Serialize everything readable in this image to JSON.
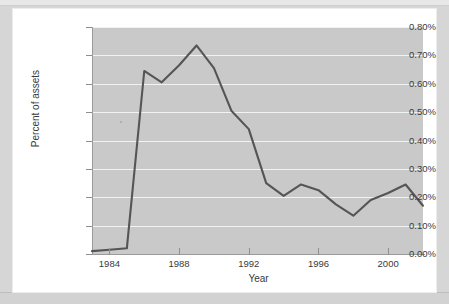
{
  "figure": {
    "background_color": "#ffffff",
    "page_background_color": "#d6d6d6",
    "plot_background_color": "#c9c9c9",
    "gridline_color": "#f2f2f2",
    "line_color": "#555555"
  },
  "chart_data": {
    "type": "line",
    "title": "",
    "xlabel": "Year",
    "ylabel": "Percent of assets",
    "xlim": [
      1983,
      2002
    ],
    "ylim": [
      0.0,
      0.8
    ],
    "grid": true,
    "legend": null,
    "yticks": [
      "0.00%",
      "0.10%",
      "0.20%",
      "0.30%",
      "0.40%",
      "0.50%",
      "0.60%",
      "0.70%",
      "0.80%"
    ],
    "ytick_values": [
      0.0,
      0.1,
      0.2,
      0.3,
      0.4,
      0.5,
      0.6,
      0.7,
      0.8
    ],
    "xticks": [
      "1984",
      "1988",
      "1992",
      "1996",
      "2000"
    ],
    "xtick_values": [
      1984,
      1988,
      1992,
      1996,
      2000
    ],
    "series": [
      {
        "name": "Percent of assets",
        "x": [
          1983,
          1984,
          1985,
          1986,
          1987,
          1988,
          1989,
          1990,
          1991,
          1992,
          1993,
          1994,
          1995,
          1996,
          1997,
          1998,
          1999,
          2000,
          2001,
          2002
        ],
        "values": [
          0.01,
          0.015,
          0.02,
          0.645,
          0.605,
          0.665,
          0.735,
          0.655,
          0.505,
          0.44,
          0.25,
          0.205,
          0.245,
          0.225,
          0.175,
          0.135,
          0.19,
          0.215,
          0.245,
          0.17
        ]
      }
    ]
  }
}
